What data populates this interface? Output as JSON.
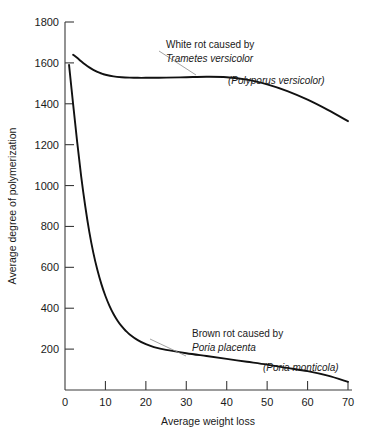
{
  "chart_data": {
    "type": "line",
    "title": "",
    "xlabel": "Average weight loss",
    "ylabel": "Average degree of polymerization",
    "xlim": [
      0,
      70
    ],
    "ylim": [
      0,
      1800
    ],
    "grid": false,
    "legend_position": "inline-annotations",
    "x_ticks": [
      0,
      10,
      20,
      30,
      40,
      50,
      60,
      70
    ],
    "x_tick_labels": [
      "0",
      "10",
      "20",
      "30",
      "40",
      "50",
      "60",
      "70"
    ],
    "y_ticks": [
      200,
      400,
      600,
      800,
      1000,
      1200,
      1400,
      1600,
      1800
    ],
    "y_tick_labels": [
      "200",
      "400",
      "600",
      "800",
      "1000",
      "1200",
      "1400",
      "1600",
      "1800"
    ],
    "series": [
      {
        "name": "White rot caused by Trametes versicolor (Polyporus versicolor)",
        "color": "#111111",
        "x": [
          2,
          3,
          4,
          5,
          6,
          7,
          8,
          9,
          10,
          12,
          14,
          16,
          18,
          20,
          25,
          30,
          35,
          40,
          45,
          50,
          55,
          60,
          65,
          70
        ],
        "y": [
          1640,
          1625,
          1608,
          1592,
          1578,
          1566,
          1556,
          1548,
          1542,
          1534,
          1530,
          1528,
          1527,
          1527,
          1528,
          1530,
          1532,
          1530,
          1518,
          1495,
          1462,
          1420,
          1370,
          1315
        ]
      },
      {
        "name": "Brown rot caused by Poria placenta (Poria monticola)",
        "color": "#111111",
        "x": [
          1,
          2,
          3,
          4,
          5,
          6,
          7,
          8,
          9,
          10,
          11,
          12,
          13,
          14,
          15,
          16,
          18,
          20,
          22,
          25,
          30,
          35,
          40,
          45,
          50,
          55,
          60,
          65,
          70
        ],
        "y": [
          1590,
          1400,
          1215,
          1045,
          900,
          775,
          672,
          588,
          518,
          460,
          412,
          372,
          339,
          312,
          290,
          272,
          244,
          224,
          210,
          196,
          180,
          166,
          152,
          138,
          124,
          108,
          92,
          70,
          40
        ]
      }
    ],
    "annotations": [
      {
        "id": "white-rot-annotation",
        "line1": "White rot caused by",
        "line2": "Trametes versicolor",
        "line3": "(Polyporus versicolor)"
      },
      {
        "id": "brown-rot-annotation",
        "line1": "Brown rot caused by",
        "line2": "Poria placenta",
        "line3": "(Poria monticola)"
      }
    ]
  }
}
